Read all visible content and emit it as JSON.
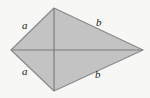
{
  "figure": {
    "kind": "kite-quadrilateral-with-diagonals",
    "background_color": "#f7f7f5",
    "fill_color": "#c3c3c3",
    "outline_color": "#8a8a8a",
    "diagonal_color": "#7d7d7d",
    "label_color": "#1c1c1c",
    "vertices": {
      "top": {
        "x": 54,
        "y": 8
      },
      "right": {
        "x": 143,
        "y": 50
      },
      "bottom": {
        "x": 54,
        "y": 91
      },
      "left": {
        "x": 11,
        "y": 50
      }
    },
    "diagonals": [
      {
        "name": "horizontal-diagonal",
        "from": "left",
        "to": "right"
      },
      {
        "name": "vertical-diagonal",
        "from": "top",
        "to": "bottom"
      }
    ],
    "labels": [
      {
        "id": "a-top",
        "text": "a",
        "side": "top-left-edge",
        "x": 22,
        "y": 20
      },
      {
        "id": "b-top",
        "text": "b",
        "side": "top-right-edge",
        "x": 96,
        "y": 17
      },
      {
        "id": "a-bottom",
        "text": "a",
        "side": "bottom-left-edge",
        "x": 22,
        "y": 66
      },
      {
        "id": "b-bottom",
        "text": "b",
        "side": "bottom-right-edge",
        "x": 95,
        "y": 69
      }
    ]
  }
}
